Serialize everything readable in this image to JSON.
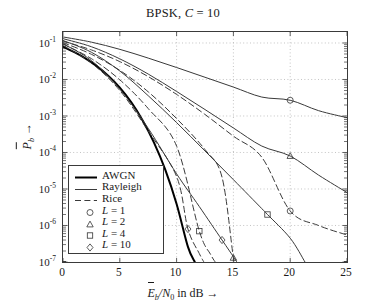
{
  "chart_data": {
    "type": "line",
    "title": "BPSK, C = 10",
    "title_parts": {
      "prefix": "BPSK, ",
      "symbol": "C",
      "rest": " = 10"
    },
    "xlabel": "Ēb/N0 in dB →",
    "ylabel": "P̄b →",
    "xlim": [
      0,
      25
    ],
    "ylim": [
      1e-07,
      0.2
    ],
    "yscale": "log",
    "xticks": [
      0,
      5,
      10,
      15,
      20,
      25
    ],
    "ytick_exponents": [
      -1,
      -2,
      -3,
      -4,
      -5,
      -6,
      -7
    ],
    "grid": true,
    "legend_position": "lower-left-inside",
    "legend": [
      {
        "label": "AWGN",
        "style": "thick-solid"
      },
      {
        "label": "Rayleigh",
        "style": "thin-solid"
      },
      {
        "label": "Rice",
        "style": "dashed"
      },
      {
        "label": "L = 1",
        "style": "marker",
        "marker": "circle"
      },
      {
        "label": "L = 2",
        "style": "marker",
        "marker": "triangle"
      },
      {
        "label": "L = 4",
        "style": "marker",
        "marker": "square"
      },
      {
        "label": "L = 10",
        "style": "marker",
        "marker": "diamond"
      }
    ],
    "series": [
      {
        "name": "AWGN",
        "style": "thick-solid",
        "marker": "none",
        "x": [
          0,
          1,
          2,
          3,
          4,
          5,
          6,
          7,
          8,
          9,
          10,
          11,
          11.6
        ],
        "y": [
          0.079,
          0.056,
          0.0375,
          0.0229,
          0.0125,
          0.006,
          0.0024,
          0.00077,
          0.00019,
          3.4e-05,
          3.9e-06,
          2.6e-07,
          1e-07
        ]
      },
      {
        "name": "Rayleigh L = 1",
        "style": "thin-solid",
        "marker": "circle",
        "x": [
          0,
          2.5,
          5,
          7.5,
          10,
          12.5,
          15,
          17.5,
          20,
          22.5,
          25
        ],
        "y": [
          0.1464,
          0.1055,
          0.067,
          0.0386,
          0.0213,
          0.0115,
          0.0062,
          0.0033,
          0.0027,
          0.0014,
          0.0009
        ],
        "markers": [
          {
            "x": 20,
            "y": 0.0027
          }
        ]
      },
      {
        "name": "Rayleigh L = 2",
        "style": "thin-solid",
        "marker": "triangle",
        "x": [
          0,
          2.5,
          5,
          7.5,
          10,
          12.5,
          15,
          17.5,
          20,
          22.5,
          25
        ],
        "y": [
          0.1314,
          0.079,
          0.0368,
          0.0141,
          0.0047,
          0.0015,
          0.00047,
          0.00015,
          8e-05,
          2.4e-05,
          8e-06
        ],
        "markers": [
          {
            "x": 20,
            "y": 8e-05
          }
        ]
      },
      {
        "name": "Rayleigh L = 4",
        "style": "thin-solid",
        "marker": "square",
        "x": [
          0,
          2.5,
          5,
          7.5,
          10,
          12.5,
          15,
          17.5,
          18,
          20,
          21.3
        ],
        "y": [
          0.1175,
          0.0557,
          0.0171,
          0.0036,
          0.00066,
          0.00011,
          1.8e-05,
          2.9e-06,
          2e-06,
          4.5e-07,
          1e-07
        ],
        "markers": [
          {
            "x": 18,
            "y": 2e-06
          }
        ]
      },
      {
        "name": "Rayleigh L = 10",
        "style": "thin-solid",
        "marker": "diamond",
        "x": [
          0,
          2.5,
          5,
          7.5,
          10,
          12,
          14,
          15,
          15.3
        ],
        "y": [
          0.0955,
          0.0331,
          0.0055,
          0.00046,
          2.6e-05,
          3.3e-06,
          4e-07,
          1.4e-07,
          1e-07
        ],
        "markers": [
          {
            "x": 14,
            "y": 4e-07
          }
        ]
      },
      {
        "name": "Rice L = 1",
        "style": "dashed",
        "marker": "circle",
        "x": [
          0,
          2.5,
          5,
          7.5,
          10,
          12.5,
          15,
          17.5,
          20,
          22.5,
          25
        ],
        "y": [
          0.1122,
          0.0646,
          0.0309,
          0.012,
          0.0039,
          0.0011,
          0.00028,
          7.4e-05,
          2.5e-06,
          1e-06,
          5.5e-07
        ],
        "markers": [
          {
            "x": 20,
            "y": 2.5e-06
          }
        ]
      },
      {
        "name": "Rice L = 2",
        "style": "dashed",
        "marker": "triangle",
        "x": [
          0,
          2.5,
          5,
          7.5,
          10,
          12.5,
          14,
          15,
          15.2
        ],
        "y": [
          0.1023,
          0.049,
          0.0178,
          0.0046,
          0.00085,
          0.00012,
          2.1e-05,
          1.3e-07,
          1e-07
        ],
        "markers": [
          {
            "x": 15,
            "y": 1.3e-07
          }
        ]
      },
      {
        "name": "Rice L = 4",
        "style": "dashed",
        "marker": "square",
        "x": [
          0,
          2.5,
          5,
          7.5,
          10,
          12,
          13,
          13.4
        ],
        "y": [
          0.0933,
          0.0372,
          0.0098,
          0.0016,
          0.00015,
          7e-07,
          1.6e-07,
          1e-07
        ],
        "markers": [
          {
            "x": 12,
            "y": 7e-07
          }
        ]
      },
      {
        "name": "Rice L = 10",
        "style": "dashed",
        "marker": "diamond",
        "x": [
          0,
          2.5,
          5,
          7.5,
          10,
          11,
          12,
          12.4
        ],
        "y": [
          0.0851,
          0.0282,
          0.005,
          0.00039,
          2.2e-05,
          8e-07,
          1.7e-07,
          1e-07
        ],
        "markers": [
          {
            "x": 11,
            "y": 8e-07
          }
        ]
      }
    ]
  }
}
